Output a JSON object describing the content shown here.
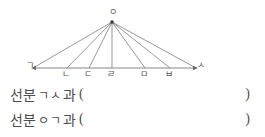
{
  "figure": {
    "name": "fan-diagram",
    "apex": {
      "label": "ㅇ",
      "x": 112,
      "y": 22
    },
    "baseline": {
      "y": 68,
      "x_start": 33,
      "x_end": 196
    },
    "points": [
      {
        "label": "ㄱ",
        "x": 33,
        "label_x": 26,
        "label_y": 61
      },
      {
        "label": "ㄴ",
        "x": 67,
        "label_x": 62,
        "label_y": 70
      },
      {
        "label": "ㄷ",
        "x": 89,
        "label_x": 84,
        "label_y": 70
      },
      {
        "label": "ㄹ",
        "x": 112,
        "label_x": 107,
        "label_y": 70
      },
      {
        "label": "ㅁ",
        "x": 145,
        "label_x": 140,
        "label_y": 70
      },
      {
        "label": "ㅂ",
        "x": 170,
        "label_x": 165,
        "label_y": 70
      },
      {
        "label": "ㅅ",
        "x": 196,
        "label_x": 197,
        "label_y": 61
      }
    ],
    "apex_label_x": 109,
    "apex_label_y": 8,
    "line_color": "#6b6b6b",
    "line_width": 0.7
  },
  "questions": [
    {
      "prefix": "선분",
      "segment": "ㄱㅅ",
      "suffix": "과",
      "paren_open": "(",
      "answer": "",
      "paren_close": ")"
    },
    {
      "prefix": "선분",
      "segment": "ㅇㄱ",
      "suffix": "과",
      "paren_open": "(",
      "answer": "",
      "paren_close": ")"
    }
  ]
}
